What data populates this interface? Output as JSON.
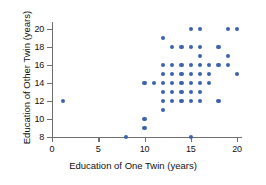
{
  "chart_data": {
    "type": "scatter",
    "title": "",
    "xlabel": "Education of One Twin (years)",
    "ylabel": "Education of Other Twin (years)",
    "xlim": [
      0,
      21
    ],
    "ylim": [
      7.2,
      20.8
    ],
    "xticks": [
      0,
      5,
      10,
      15,
      20
    ],
    "yticks": [
      8,
      10,
      12,
      14,
      16,
      18,
      20
    ],
    "xtick_labels": [
      "0",
      "5",
      "10",
      "15",
      "20"
    ],
    "ytick_labels": [
      "8",
      "10",
      "12",
      "14",
      "16",
      "18",
      "20"
    ],
    "grid": false,
    "legend": "none",
    "marker_color": "#3d63ad",
    "axis_color": "#6f6f6f",
    "points": [
      {
        "x": 1.2,
        "y": 12
      },
      {
        "x": 8,
        "y": 8
      },
      {
        "x": 10,
        "y": 9
      },
      {
        "x": 10,
        "y": 10
      },
      {
        "x": 10,
        "y": 14
      },
      {
        "x": 11,
        "y": 14
      },
      {
        "x": 12,
        "y": 11
      },
      {
        "x": 12,
        "y": 12
      },
      {
        "x": 12,
        "y": 13
      },
      {
        "x": 12,
        "y": 14
      },
      {
        "x": 12,
        "y": 15
      },
      {
        "x": 12,
        "y": 16
      },
      {
        "x": 12,
        "y": 19
      },
      {
        "x": 13,
        "y": 12
      },
      {
        "x": 13,
        "y": 13
      },
      {
        "x": 13,
        "y": 14
      },
      {
        "x": 13,
        "y": 15
      },
      {
        "x": 13,
        "y": 16
      },
      {
        "x": 13,
        "y": 18
      },
      {
        "x": 14,
        "y": 12
      },
      {
        "x": 14,
        "y": 13
      },
      {
        "x": 14,
        "y": 14
      },
      {
        "x": 14,
        "y": 15
      },
      {
        "x": 14,
        "y": 16
      },
      {
        "x": 14,
        "y": 18
      },
      {
        "x": 15,
        "y": 8
      },
      {
        "x": 15,
        "y": 12
      },
      {
        "x": 15,
        "y": 13
      },
      {
        "x": 15,
        "y": 14
      },
      {
        "x": 15,
        "y": 15
      },
      {
        "x": 15,
        "y": 16
      },
      {
        "x": 15,
        "y": 18
      },
      {
        "x": 15,
        "y": 20
      },
      {
        "x": 16,
        "y": 12
      },
      {
        "x": 16,
        "y": 13
      },
      {
        "x": 16,
        "y": 14
      },
      {
        "x": 16,
        "y": 15
      },
      {
        "x": 16,
        "y": 16
      },
      {
        "x": 16,
        "y": 17
      },
      {
        "x": 16,
        "y": 18
      },
      {
        "x": 16,
        "y": 20
      },
      {
        "x": 17,
        "y": 14
      },
      {
        "x": 17,
        "y": 15
      },
      {
        "x": 17,
        "y": 16
      },
      {
        "x": 18,
        "y": 12
      },
      {
        "x": 18,
        "y": 16
      },
      {
        "x": 18,
        "y": 18
      },
      {
        "x": 19,
        "y": 16
      },
      {
        "x": 19,
        "y": 17
      },
      {
        "x": 19,
        "y": 20
      },
      {
        "x": 20,
        "y": 15
      },
      {
        "x": 20,
        "y": 20
      }
    ]
  },
  "plot_geometry": {
    "x_origin_px": 52,
    "y_origin_px": 137,
    "px_per_x_unit": 9.25,
    "px_per_y_unit": 9.0,
    "y_value_at_origin": 8
  }
}
